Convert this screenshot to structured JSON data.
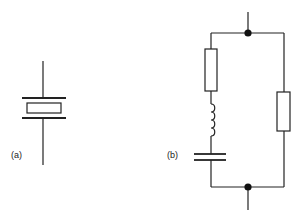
{
  "diagram": {
    "type": "circuit-schematic",
    "parts": [
      {
        "id": "a",
        "label": "(a)",
        "description": "Crystal resonator symbol: rectangle between two plates with leads"
      },
      {
        "id": "b",
        "label": "(b)",
        "description": "Equivalent circuit: series resistor, inductor and capacitor in parallel with a resistor between two nodes"
      }
    ],
    "colors": {
      "line": "#222222",
      "background": "#ffffff"
    }
  }
}
